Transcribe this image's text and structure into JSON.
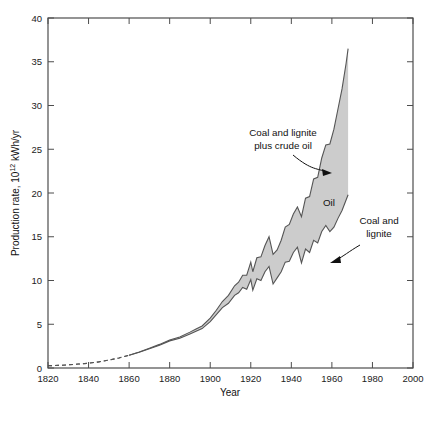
{
  "chart_data": {
    "type": "area",
    "title": "",
    "xlabel": "Year",
    "ylabel": "Production rate, 10¹² kWh/yr",
    "xlim": [
      1820,
      2000
    ],
    "ylim": [
      0,
      40
    ],
    "xticks": [
      1820,
      1840,
      1860,
      1880,
      1900,
      1920,
      1940,
      1960,
      1980,
      2000
    ],
    "yticks": [
      0,
      5,
      10,
      15,
      20,
      25,
      30,
      35,
      40
    ],
    "grid": false,
    "legend_position": "inline-annotations",
    "annotations": [
      {
        "name": "total-band-label",
        "text_line1": "Coal and lignite",
        "text_line2": "plus crude oil",
        "arrow": true
      },
      {
        "name": "oil-band-label",
        "text_line1": "Oil",
        "text_line2": "",
        "arrow": false
      },
      {
        "name": "coal-lignite-label",
        "text_line1": "Coal and",
        "text_line2": "lignite",
        "arrow": true
      }
    ],
    "series": [
      {
        "name": "Coal and lignite",
        "style": "solid-with-dashed-head",
        "dashed_until_year": 1862,
        "x": [
          1820,
          1825,
          1830,
          1835,
          1840,
          1845,
          1850,
          1855,
          1860,
          1865,
          1870,
          1875,
          1880,
          1885,
          1890,
          1893,
          1896,
          1900,
          1903,
          1906,
          1909,
          1912,
          1914,
          1916,
          1918,
          1920,
          1921,
          1923,
          1925,
          1927,
          1929,
          1931,
          1933,
          1935,
          1937,
          1939,
          1941,
          1943,
          1945,
          1947,
          1949,
          1951,
          1953,
          1955,
          1957,
          1959,
          1961,
          1963,
          1965,
          1967,
          1968
        ],
        "values": [
          0.25,
          0.3,
          0.36,
          0.45,
          0.55,
          0.7,
          0.9,
          1.15,
          1.45,
          1.8,
          2.2,
          2.6,
          3.1,
          3.4,
          3.9,
          4.2,
          4.5,
          5.3,
          6.1,
          6.9,
          7.4,
          8.3,
          8.6,
          9.2,
          9.0,
          10.1,
          8.9,
          10.2,
          10.0,
          11.0,
          11.6,
          9.6,
          10.3,
          11.0,
          12.1,
          12.2,
          13.2,
          13.8,
          12.0,
          13.6,
          13.2,
          14.6,
          14.3,
          15.6,
          16.3,
          15.6,
          16.1,
          17.1,
          18.0,
          19.2,
          19.8
        ]
      },
      {
        "name": "Coal and lignite plus crude oil",
        "style": "solid-with-dashed-head",
        "dashed_until_year": 1862,
        "x": [
          1820,
          1825,
          1830,
          1835,
          1840,
          1845,
          1850,
          1855,
          1860,
          1865,
          1870,
          1875,
          1880,
          1885,
          1890,
          1893,
          1896,
          1900,
          1903,
          1906,
          1909,
          1912,
          1914,
          1916,
          1918,
          1920,
          1921,
          1923,
          1925,
          1927,
          1929,
          1931,
          1933,
          1935,
          1937,
          1939,
          1941,
          1943,
          1945,
          1947,
          1949,
          1951,
          1953,
          1955,
          1957,
          1959,
          1961,
          1963,
          1965,
          1967,
          1968
        ],
        "values": [
          0.25,
          0.3,
          0.36,
          0.45,
          0.55,
          0.7,
          0.9,
          1.15,
          1.45,
          1.82,
          2.25,
          2.7,
          3.2,
          3.55,
          4.1,
          4.45,
          4.8,
          5.7,
          6.6,
          7.6,
          8.3,
          9.4,
          9.8,
          10.6,
          10.6,
          12.1,
          11.0,
          12.6,
          12.7,
          14.0,
          15.0,
          13.0,
          13.5,
          14.6,
          16.1,
          16.4,
          17.6,
          18.4,
          17.3,
          19.4,
          19.6,
          21.6,
          21.8,
          24.0,
          25.5,
          25.6,
          27.3,
          29.6,
          31.9,
          34.8,
          36.5
        ]
      }
    ],
    "band_fill_color": "#cccccc",
    "line_color": "#555555"
  },
  "axes": {
    "x_tick_labels": [
      "1820",
      "1840",
      "1860",
      "1880",
      "1900",
      "1920",
      "1940",
      "1960",
      "1980",
      "2000"
    ],
    "y_tick_labels": [
      "0",
      "5",
      "10",
      "15",
      "20",
      "25",
      "30",
      "35",
      "40"
    ],
    "x_axis_title": "Year",
    "y_axis_title": "Production rate, 10¹² kWh/yr"
  },
  "labels": {
    "total": {
      "line1": "Coal and lignite",
      "line2": "plus crude oil"
    },
    "oil": "Oil",
    "coal": {
      "line1": "Coal and",
      "line2": "lignite"
    }
  },
  "caption": {
    "ghost_text": ""
  }
}
